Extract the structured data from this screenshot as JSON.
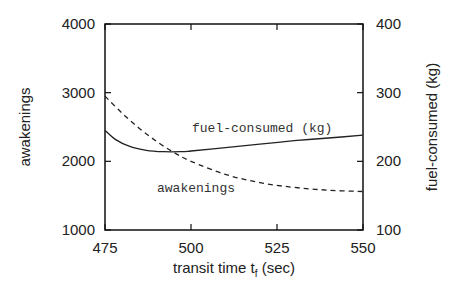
{
  "chart_data": {
    "type": "line",
    "title": "",
    "xlabel": "transit time t_f (sec)",
    "xlabel_main": "transit time t",
    "xlabel_sub": "f",
    "xlabel_unit": " (sec)",
    "ylabel_left": "awakenings",
    "ylabel_right": "fuel-consumed (kg)",
    "xlim": [
      475,
      550
    ],
    "ylim_left": [
      1000,
      4000
    ],
    "ylim_right": [
      100,
      400
    ],
    "x_ticks": [
      475,
      500,
      525,
      550
    ],
    "y_ticks_left": [
      1000,
      2000,
      3000,
      4000
    ],
    "y_ticks_right": [
      100,
      200,
      300,
      400
    ],
    "grid": false,
    "legend": "inline labels",
    "series": [
      {
        "name": "awakenings",
        "axis": "left",
        "style": "dashed",
        "label": "awakenings",
        "x": [
          475,
          480,
          485,
          490,
          495,
          500,
          510,
          520,
          530,
          540,
          550
        ],
        "values": [
          2950,
          2700,
          2480,
          2290,
          2130,
          2000,
          1810,
          1690,
          1620,
          1580,
          1560
        ]
      },
      {
        "name": "fuel-consumed (kg)",
        "axis": "right",
        "style": "solid",
        "label": "fuel-consumed (kg)",
        "x": [
          475,
          478,
          482,
          487,
          492,
          497,
          500,
          510,
          520,
          530,
          540,
          550
        ],
        "values": [
          245,
          232,
          222,
          216,
          214,
          214,
          215,
          220,
          225,
          230,
          234,
          238
        ]
      }
    ],
    "annotations": [
      {
        "text": "fuel-consumed (kg)",
        "x": 497,
        "y_left": 2450
      },
      {
        "text": "awakenings",
        "x": 489,
        "y_left": 1590
      }
    ]
  }
}
